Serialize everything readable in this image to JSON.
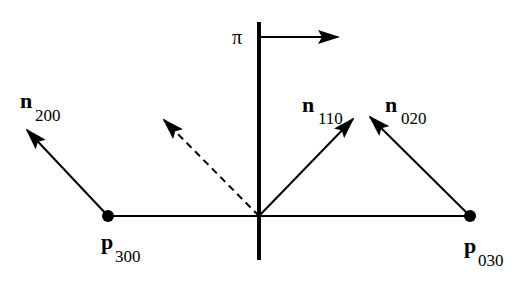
{
  "diagram": {
    "type": "geometric vector diagram",
    "colors": {
      "stroke": "#000000",
      "background": "#ffffff"
    },
    "plane": {
      "label": "π"
    },
    "points": [
      {
        "id": "p300",
        "base": "p",
        "subscript": "300"
      },
      {
        "id": "p030",
        "base": "p",
        "subscript": "030"
      }
    ],
    "normals": [
      {
        "id": "n200",
        "base": "n",
        "subscript": "200",
        "style": "solid"
      },
      {
        "id": "n110",
        "base": "n",
        "subscript": "110",
        "style": "solid"
      },
      {
        "id": "n020",
        "base": "n",
        "subscript": "020",
        "style": "solid"
      },
      {
        "id": "n110-reflected",
        "style": "dashed"
      }
    ]
  }
}
